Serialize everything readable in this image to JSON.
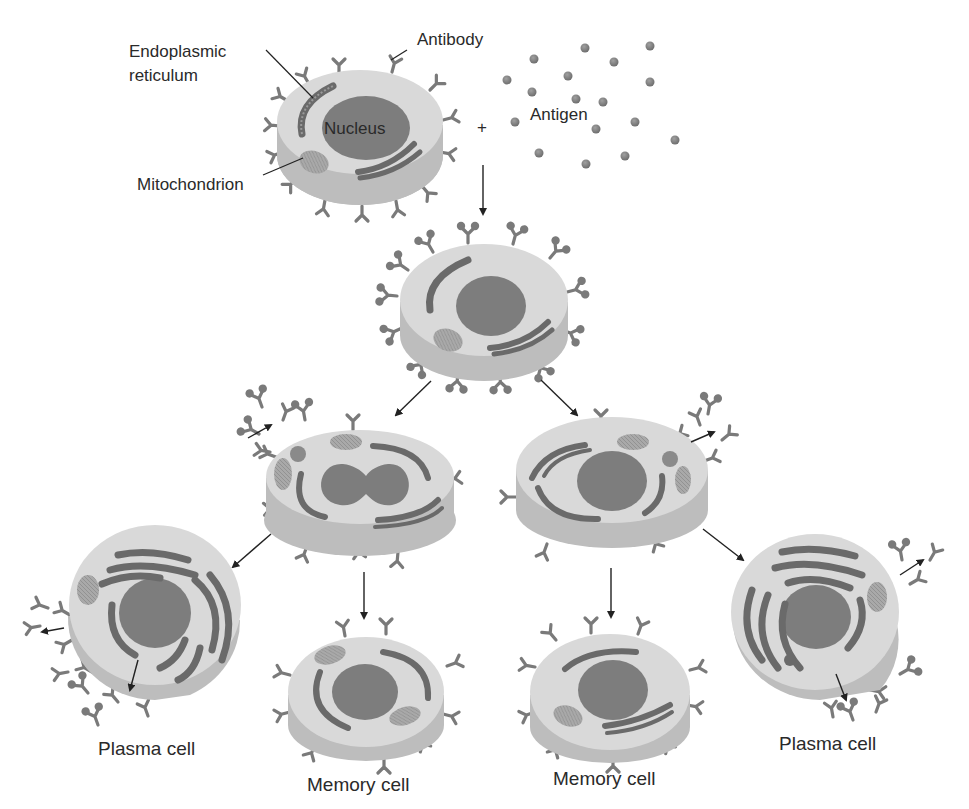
{
  "labels": {
    "endoplasmic_reticulum_line1": "Endoplasmic",
    "endoplasmic_reticulum_line2": "reticulum",
    "antibody": "Antibody",
    "nucleus": "Nucleus",
    "mitochondrion": "Mitochondrion",
    "antigen": "Antigen",
    "plus": "+",
    "plasma_cell_left": "Plasma cell",
    "memory_cell_left": "Memory cell",
    "memory_cell_right": "Memory cell",
    "plasma_cell_right": "Plasma cell"
  },
  "colors": {
    "background": "#ffffff",
    "cell_top": "#d9d9d9",
    "cell_side": "#bdbdbd",
    "nucleus": "#7d7d7d",
    "organelle": "#6e6e6e",
    "mitochondrion": "#a8a8a8",
    "antibody": "#7a7a7a",
    "antigen": "#7a7a7a",
    "arrow": "#222222",
    "text": "#2a2a2a"
  },
  "cells": [
    {
      "id": "naive-b-cell",
      "cx": 360,
      "cy": 125,
      "rx": 85,
      "ry": 58,
      "depth": 30
    },
    {
      "id": "antigen-bound-b-cell",
      "cx": 482,
      "cy": 305,
      "rx": 88,
      "ry": 62,
      "depth": 32
    },
    {
      "id": "dividing-cell-left",
      "cx": 360,
      "cy": 490,
      "rx": 98,
      "ry": 60,
      "depth": 38
    },
    {
      "id": "dividing-cell-right",
      "cx": 612,
      "cy": 480,
      "rx": 98,
      "ry": 62,
      "depth": 36
    },
    {
      "id": "plasma-cell-left",
      "cx": 155,
      "cy": 620,
      "rx": 88,
      "ry": 85,
      "depth": 20
    },
    {
      "id": "memory-cell-left",
      "cx": 366,
      "cy": 700,
      "rx": 80,
      "ry": 55,
      "depth": 30
    },
    {
      "id": "memory-cell-right",
      "cx": 608,
      "cy": 700,
      "rx": 82,
      "ry": 57,
      "depth": 30
    },
    {
      "id": "plasma-cell-right",
      "cx": 820,
      "cy": 630,
      "rx": 88,
      "ry": 82,
      "depth": 20
    }
  ],
  "antigen_particles": [
    [
      585,
      48
    ],
    [
      650,
      46
    ],
    [
      534,
      59
    ],
    [
      614,
      62
    ],
    [
      507,
      80
    ],
    [
      568,
      76
    ],
    [
      650,
      82
    ],
    [
      532,
      92
    ],
    [
      576,
      99
    ],
    [
      603,
      102
    ],
    [
      515,
      122
    ],
    [
      596,
      129
    ],
    [
      635,
      122
    ],
    [
      675,
      140
    ],
    [
      539,
      153
    ],
    [
      625,
      156
    ],
    [
      586,
      164
    ]
  ],
  "arrows": [
    {
      "from": [
        483,
        165
      ],
      "to": [
        483,
        214
      ]
    },
    {
      "from": [
        431,
        381
      ],
      "to": [
        396,
        415
      ]
    },
    {
      "from": [
        541,
        380
      ],
      "to": [
        577,
        415
      ]
    },
    {
      "from": [
        271,
        534
      ],
      "to": [
        233,
        567
      ]
    },
    {
      "from": [
        364,
        572
      ],
      "to": [
        364,
        618
      ]
    },
    {
      "from": [
        611,
        568
      ],
      "to": [
        611,
        617
      ]
    },
    {
      "from": [
        703,
        529
      ],
      "to": [
        743,
        560
      ]
    },
    {
      "from": [
        64,
        628
      ],
      "to": [
        42,
        632
      ]
    },
    {
      "from": [
        138,
        660
      ],
      "to": [
        130,
        690
      ]
    },
    {
      "from": [
        248,
        438
      ],
      "to": [
        271,
        425
      ]
    },
    {
      "from": [
        691,
        442
      ],
      "to": [
        714,
        432
      ]
    },
    {
      "from": [
        900,
        575
      ],
      "to": [
        923,
        560
      ]
    },
    {
      "from": [
        836,
        674
      ],
      "to": [
        846,
        700
      ]
    }
  ]
}
